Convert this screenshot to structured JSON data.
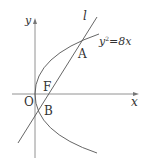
{
  "diagram": {
    "type": "parabola-with-focal-chord",
    "axes": {
      "x_label": "x",
      "y_label": "y",
      "origin_label": "O"
    },
    "curve": {
      "equation_prefix": "y",
      "equation_exp": "2",
      "equation_suffix": "=8x"
    },
    "line": {
      "label": "l"
    },
    "points": [
      {
        "label": "A"
      },
      {
        "label": "F"
      },
      {
        "label": "B"
      }
    ],
    "colors": {
      "stroke": "#555555",
      "text": "#333333",
      "background": "#ffffff"
    }
  }
}
